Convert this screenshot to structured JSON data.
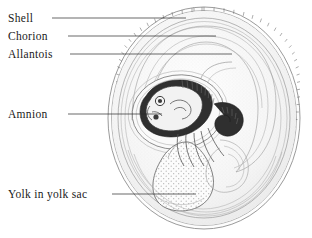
{
  "figure": {
    "background_color": "#ffffff",
    "ink_color": "#1a1a1a",
    "width": 312,
    "height": 238
  },
  "labels": [
    {
      "id": "shell",
      "text": "Shell",
      "text_x": 8,
      "text_y": 22,
      "leader_x1": 52,
      "leader_y1": 18,
      "leader_x2": 186,
      "leader_y2": 18,
      "icon": "leader-line-icon"
    },
    {
      "id": "chorion",
      "text": "Chorion",
      "text_x": 8,
      "text_y": 40,
      "leader_x1": 68,
      "leader_y1": 36,
      "leader_x2": 216,
      "leader_y2": 36,
      "icon": "leader-line-icon"
    },
    {
      "id": "allantois",
      "text": "Allantois",
      "text_x": 8,
      "text_y": 58,
      "leader_x1": 70,
      "leader_y1": 54,
      "leader_x2": 232,
      "leader_y2": 54,
      "icon": "leader-line-icon"
    },
    {
      "id": "amnion",
      "text": "Amnion",
      "text_x": 8,
      "text_y": 118,
      "leader_x1": 68,
      "leader_y1": 114,
      "leader_x2": 162,
      "leader_y2": 114,
      "icon": "leader-line-icon"
    },
    {
      "id": "yolk-in-yolk-sac",
      "text": "Yolk in yolk sac",
      "text_x": 8,
      "text_y": 198,
      "leader_x1": 112,
      "leader_y1": 194,
      "leader_x2": 196,
      "leader_y2": 194,
      "icon": "leader-line-icon"
    }
  ],
  "structures": {
    "shell_label": "Shell",
    "chorion_label": "Chorion",
    "allantois_label": "Allantois",
    "amnion_label": "Amnion",
    "yolk_label": "Yolk in yolk sac",
    "embryo_label": "Embryo"
  },
  "colors": {
    "shell_stroke": "#8e8e8e",
    "membrane_stroke": "#9a9a9a",
    "albumen_fill": "#f7f7f7",
    "embryo_dark": "#2f2f2f",
    "yolk_fill": "#fcfcfc",
    "leader_stroke": "#2a2a2a"
  }
}
